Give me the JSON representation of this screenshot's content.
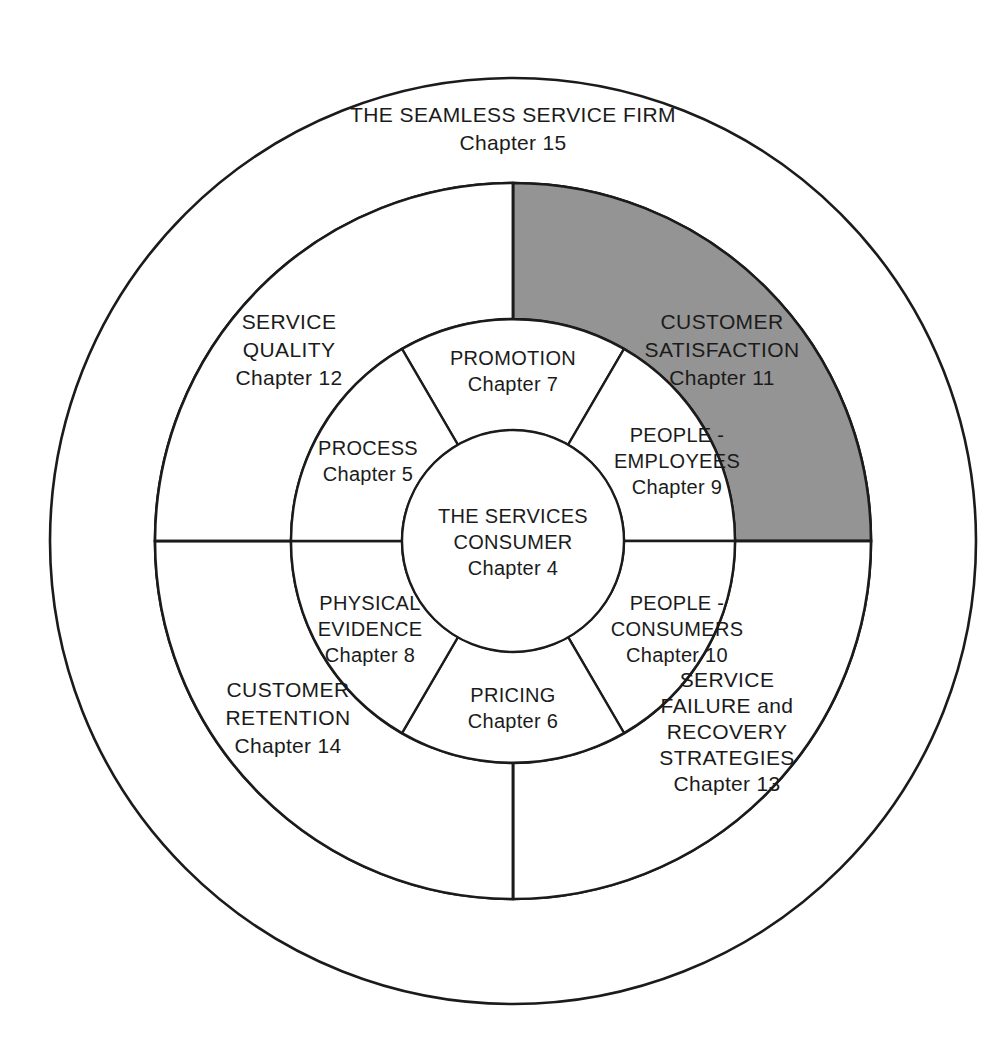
{
  "diagram": {
    "type": "concentric-ring-diagram",
    "geometry": {
      "center_x": 513,
      "center_y": 541,
      "r_outer": 463,
      "r_ring_outer_inner": 358,
      "r_middle_outer": 358,
      "r_middle_inner": 222,
      "r_inner_outer": 222,
      "r_core": 111
    },
    "colors": {
      "stroke": "#1b1b1b",
      "background": "#ffffff",
      "highlight_fill": "#949494"
    },
    "core": {
      "lines": [
        "THE SERVICES",
        "CONSUMER"
      ],
      "chapter": "Chapter 4"
    },
    "outer_ring": {
      "lines": [
        "THE SEAMLESS SERVICE FIRM"
      ],
      "chapter": "Chapter 15"
    },
    "inner_ring_segments": [
      {
        "id": "promotion",
        "lines": [
          "PROMOTION"
        ],
        "chapter": "Chapter 7",
        "start_angle": -120,
        "end_angle": -60,
        "label_x": 513,
        "label_y": 372
      },
      {
        "id": "people-employees",
        "lines": [
          "PEOPLE -",
          "EMPLOYEES"
        ],
        "chapter": "Chapter 9",
        "start_angle": -60,
        "end_angle": 0,
        "label_x": 677,
        "label_y": 450
      },
      {
        "id": "people-consumers",
        "lines": [
          "PEOPLE -",
          "CONSUMERS"
        ],
        "chapter": "Chapter 10",
        "start_angle": 0,
        "end_angle": 60,
        "label_x": 677,
        "label_y": 622
      },
      {
        "id": "pricing",
        "lines": [
          "PRICING"
        ],
        "chapter": "Chapter 6",
        "start_angle": 60,
        "end_angle": 120,
        "label_x": 513,
        "label_y": 708
      },
      {
        "id": "physical-evidence",
        "lines": [
          "PHYSICAL",
          "EVIDENCE"
        ],
        "chapter": "Chapter 8",
        "start_angle": 120,
        "end_angle": 180,
        "label_x": 370,
        "label_y": 617
      },
      {
        "id": "process",
        "lines": [
          "PROCESS"
        ],
        "chapter": "Chapter 5",
        "start_angle": 180,
        "end_angle": 240,
        "label_x": 368,
        "label_y": 449
      }
    ],
    "middle_ring_quadrants": [
      {
        "id": "customer-satisfaction",
        "lines": [
          "CUSTOMER",
          "SATISFACTION"
        ],
        "chapter": "Chapter 11",
        "start_angle": -90,
        "end_angle": 0,
        "shaded": true,
        "fill": "#949494",
        "label_x": 718,
        "label_y": 345
      },
      {
        "id": "service-failure-and-recovery-strategies",
        "lines": [
          "SERVICE",
          "FAILURE and",
          "RECOVERY",
          "STRATEGIES"
        ],
        "chapter": "Chapter 13",
        "start_angle": 0,
        "end_angle": 90,
        "shaded": false,
        "fill": "#ffffff",
        "label_x": 727,
        "label_y": 705
      },
      {
        "id": "customer-retention",
        "lines": [
          "CUSTOMER",
          "RETENTION"
        ],
        "chapter": "Chapter 14",
        "start_angle": 90,
        "end_angle": 180,
        "shaded": false,
        "fill": "#ffffff",
        "label_x": 288,
        "label_y": 712
      },
      {
        "id": "service-quality",
        "lines": [
          "SERVICE",
          "QUALITY"
        ],
        "chapter": "Chapter 12",
        "start_angle": 180,
        "end_angle": 270,
        "shaded": false,
        "fill": "#ffffff",
        "label_x": 289,
        "label_y": 345
      }
    ]
  }
}
